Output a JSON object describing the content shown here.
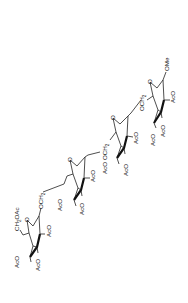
{
  "diagram": {
    "type": "chemical-structure",
    "rings": [
      {
        "id": "ring1",
        "ring_oxygen": "O",
        "substituents": [
          "AcO",
          "AcO",
          "AcO"
        ],
        "side_chain": {
          "text": "CH",
          "sub": "2",
          "tail": "OAc"
        },
        "linkage": {
          "text": "OCH",
          "sub": "2"
        }
      },
      {
        "id": "ring2",
        "ring_oxygen": "O",
        "substituents": [
          "AcO",
          "AcO",
          "AcO"
        ]
      },
      {
        "id": "ring3",
        "ring_oxygen": "O",
        "substituents": [
          "AcO",
          "AcO",
          "AcO"
        ],
        "linkage": {
          "text": "OCH",
          "sub": "2"
        }
      },
      {
        "id": "ring4",
        "ring_oxygen": "O",
        "substituents": [
          "AcO",
          "AcO",
          "AcO"
        ],
        "linkage": {
          "text": "OCH",
          "sub": "2"
        },
        "aglycone": "OMe"
      }
    ]
  }
}
